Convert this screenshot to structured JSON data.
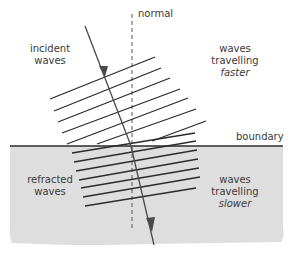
{
  "diagram": {
    "colors": {
      "background": "#ffffff",
      "slow_medium": "#dedede",
      "line": "#2b2b2b",
      "ray": "#4a4a4a",
      "text": "#3a3a3a"
    },
    "labels": {
      "normal": "normal",
      "incident_line1": "incident",
      "incident_line2": "waves",
      "faster_line1": "waves",
      "faster_line2": "travelling",
      "faster_line3": "faster",
      "boundary": "boundary",
      "refracted_line1": "refracted",
      "refracted_line2": "waves",
      "slower_line1": "waves",
      "slower_line2": "travelling",
      "slower_line3": "slower"
    },
    "elements": {
      "boundary_y": 146,
      "normal_x": 132,
      "incident_wavefronts": 7,
      "refracted_wavefronts": 7,
      "ray_direction_icon": "arrow-head"
    }
  }
}
